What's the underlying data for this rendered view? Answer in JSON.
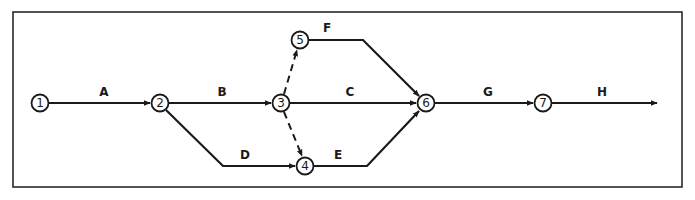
{
  "diagram": {
    "type": "activity-on-arrow network",
    "frame": {
      "x": 13,
      "y": 12,
      "w": 669,
      "h": 175
    },
    "nodes": [
      {
        "id": "1",
        "label": "1",
        "x": 40,
        "y": 103
      },
      {
        "id": "2",
        "label": "2",
        "x": 160,
        "y": 103
      },
      {
        "id": "3",
        "label": "3",
        "x": 281,
        "y": 103
      },
      {
        "id": "4",
        "label": "4",
        "x": 305,
        "y": 166
      },
      {
        "id": "5",
        "label": "5",
        "x": 300,
        "y": 40
      },
      {
        "id": "6",
        "label": "6",
        "x": 426,
        "y": 103
      },
      {
        "id": "7",
        "label": "7",
        "x": 543,
        "y": 103
      }
    ],
    "activities": [
      {
        "label": "A",
        "from": "1",
        "to": "2",
        "dashed": false,
        "label_x": 104,
        "label_y": 96
      },
      {
        "label": "B",
        "from": "2",
        "to": "3",
        "dashed": false,
        "label_x": 222,
        "label_y": 96
      },
      {
        "label": "C",
        "from": "3",
        "to": "6",
        "dashed": false,
        "label_x": 350,
        "label_y": 96
      },
      {
        "label": "D",
        "from": "2",
        "to": "4",
        "dashed": false,
        "label_x": 245,
        "label_y": 159
      },
      {
        "label": "E",
        "from": "4",
        "to": "6",
        "dashed": false,
        "label_x": 338,
        "label_y": 159
      },
      {
        "label": "F",
        "from": "5",
        "to": "6",
        "dashed": false,
        "label_x": 327,
        "label_y": 32
      },
      {
        "label": "G",
        "from": "6",
        "to": "7",
        "dashed": false,
        "label_x": 488,
        "label_y": 96
      },
      {
        "label": "H",
        "from": "7",
        "to": "end",
        "dashed": false,
        "label_x": 602,
        "label_y": 96
      },
      {
        "label": "",
        "from": "3",
        "to": "5",
        "dashed": true
      },
      {
        "label": "",
        "from": "3",
        "to": "4",
        "dashed": true
      }
    ]
  }
}
